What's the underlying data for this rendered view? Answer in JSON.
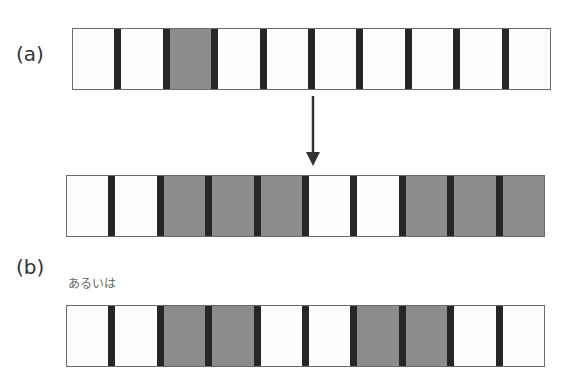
{
  "labels": {
    "a": "(a)",
    "b": "(b)",
    "or_text": "あるいは"
  },
  "colors": {
    "white_cell": "#fdfdfd",
    "gray_cell": "#8c8c8c",
    "separator": "#262626",
    "border": "#6b6b6b",
    "arrow": "#333333"
  },
  "rows": [
    {
      "id": "a-initial",
      "cells": [
        "white",
        "white",
        "gray",
        "white",
        "white",
        "white",
        "white",
        "white",
        "white",
        "white"
      ]
    },
    {
      "id": "b-result-1",
      "cells": [
        "white",
        "white",
        "gray",
        "gray",
        "gray",
        "white",
        "white",
        "gray",
        "gray",
        "gray"
      ]
    },
    {
      "id": "b-result-2",
      "cells": [
        "white",
        "white",
        "gray",
        "gray",
        "white",
        "white",
        "gray",
        "gray",
        "white",
        "white"
      ]
    }
  ]
}
